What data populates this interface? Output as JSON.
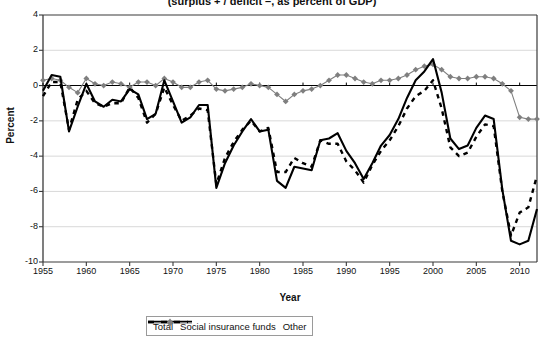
{
  "chart_data": {
    "type": "line",
    "title": "(surplus + / deficit –, as percent of GDP)",
    "xlabel": "Year",
    "ylabel": "Percent",
    "xlim": [
      1955,
      2012
    ],
    "ylim": [
      -10,
      4
    ],
    "yticks": [
      4,
      2,
      0,
      -2,
      -4,
      -6,
      -8,
      -10
    ],
    "xticks": [
      1955,
      1960,
      1965,
      1970,
      1975,
      1980,
      1985,
      1990,
      1995,
      2000,
      2005,
      2010
    ],
    "grid": "horizontal",
    "legend_position": "bottom",
    "x": [
      1955,
      1956,
      1957,
      1958,
      1959,
      1960,
      1961,
      1962,
      1963,
      1964,
      1965,
      1966,
      1967,
      1968,
      1969,
      1970,
      1971,
      1972,
      1973,
      1974,
      1975,
      1976,
      1977,
      1978,
      1979,
      1980,
      1981,
      1982,
      1983,
      1984,
      1985,
      1986,
      1987,
      1988,
      1989,
      1990,
      1991,
      1992,
      1993,
      1994,
      1995,
      1996,
      1997,
      1998,
      1999,
      2000,
      2001,
      2002,
      2003,
      2004,
      2005,
      2006,
      2007,
      2008,
      2009,
      2010,
      2011,
      2012
    ],
    "series": [
      {
        "name": "Total",
        "color": "#000000",
        "style": "solid",
        "values": [
          -0.3,
          0.6,
          0.5,
          -2.6,
          -1.2,
          0.1,
          -0.9,
          -1.2,
          -0.8,
          -0.9,
          -0.2,
          -0.5,
          -1.9,
          -1.6,
          0.3,
          -0.9,
          -2.1,
          -1.8,
          -1.1,
          -1.1,
          -5.8,
          -4.4,
          -3.4,
          -2.6,
          -1.9,
          -2.6,
          -2.5,
          -5.4,
          -5.8,
          -4.6,
          -4.7,
          -4.8,
          -3.1,
          -3.0,
          -2.7,
          -3.7,
          -4.4,
          -5.3,
          -4.4,
          -3.4,
          -2.8,
          -1.9,
          -0.7,
          0.3,
          0.8,
          1.5,
          -0.4,
          -3.0,
          -3.6,
          -3.4,
          -2.4,
          -1.7,
          -1.9,
          -5.9,
          -8.8,
          -9.0,
          -8.8,
          -7.0
        ]
      },
      {
        "name": "Social insurance funds",
        "color": "#7f7f7f",
        "style": "solid-diamond",
        "values": [
          0.3,
          0.4,
          0.3,
          -0.1,
          -0.4,
          0.4,
          0.1,
          0.0,
          0.2,
          0.1,
          -0.1,
          0.2,
          0.2,
          0.0,
          0.4,
          0.2,
          -0.1,
          -0.1,
          0.2,
          0.3,
          -0.2,
          -0.3,
          -0.2,
          -0.1,
          0.1,
          0.0,
          -0.1,
          -0.5,
          -0.9,
          -0.5,
          -0.3,
          -0.2,
          0.0,
          0.3,
          0.6,
          0.6,
          0.4,
          0.2,
          0.1,
          0.3,
          0.3,
          0.4,
          0.6,
          0.9,
          1.1,
          1.2,
          0.9,
          0.5,
          0.4,
          0.4,
          0.5,
          0.5,
          0.4,
          0.1,
          -0.3,
          -1.8,
          -1.9,
          -1.9
        ]
      },
      {
        "name": "Other",
        "color": "#000000",
        "style": "dashed",
        "values": [
          -0.6,
          0.2,
          0.2,
          -2.5,
          -0.8,
          -0.3,
          -1.0,
          -1.2,
          -1.0,
          -1.0,
          -0.1,
          -0.7,
          -2.1,
          -1.6,
          -0.1,
          -1.1,
          -2.0,
          -1.7,
          -1.3,
          -1.4,
          -5.6,
          -4.1,
          -3.2,
          -2.5,
          -2.0,
          -2.6,
          -2.4,
          -4.9,
          -4.9,
          -4.1,
          -4.4,
          -4.6,
          -3.1,
          -3.3,
          -3.3,
          -4.3,
          -4.8,
          -5.5,
          -4.5,
          -3.7,
          -3.1,
          -2.3,
          -1.3,
          -0.6,
          -0.3,
          0.3,
          -1.3,
          -3.5,
          -4.0,
          -3.8,
          -2.9,
          -2.2,
          -2.3,
          -6.0,
          -8.5,
          -7.2,
          -6.9,
          -5.1
        ]
      }
    ]
  },
  "legend": {
    "items": [
      {
        "label": "Total"
      },
      {
        "label": "Social insurance funds"
      },
      {
        "label": "Other"
      }
    ]
  }
}
